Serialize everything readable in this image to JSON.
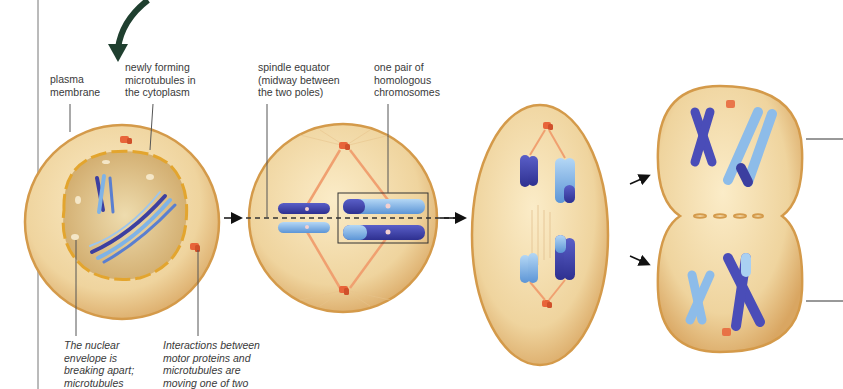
{
  "diagram": {
    "colors": {
      "cell_fill": "#f1dcae",
      "cell_membrane": "#d8a050",
      "nucleus_fill": "#e2c690",
      "nuclear_envelope": "#e3a52e",
      "chromosome_dark": "#3c3fa0",
      "chromosome_light": "#7fb3e6",
      "centrosome": "#e8643a",
      "spindle": "#f0a070",
      "arrow_green": "#1f3f2f",
      "leader_line": "#555555"
    },
    "stages": [
      {
        "name": "prometaphase",
        "label": "Prometaphase cell"
      },
      {
        "name": "metaphase",
        "label": "Metaphase cell"
      },
      {
        "name": "anaphase",
        "label": "Anaphase cell"
      },
      {
        "name": "telophase",
        "label": "Telophase / cytokinesis cell"
      }
    ]
  },
  "labels": {
    "plasma_membrane": "plasma\nmembrane",
    "newly_forming_microtubules": "newly forming\nmicrotubules in\nthe cytoplasm",
    "spindle_equator": "spindle equator\n(midway between\nthe two poles)",
    "homologous_pair": "one pair of\nhomologous\nchromosomes",
    "nuclear_envelope_note": "The nuclear\nenvelope is\nbreaking apart;\nmicrotubules",
    "motor_proteins_note": "Interactions between\nmotor proteins and\nmicrotubules are\nmoving one of two"
  }
}
